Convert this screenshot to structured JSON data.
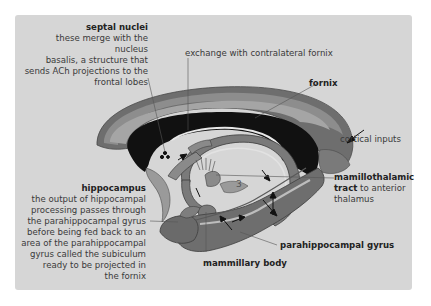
{
  "figure": {
    "labels": {
      "septal_nuclei": {
        "title": "septal nuclei",
        "body": [
          "these merge with the nucleus",
          "basalis, a structure that",
          "sends ACh projections to the",
          "frontal lobes"
        ]
      },
      "exchange": {
        "text": "exchange with contralateral fornix"
      },
      "fornix": {
        "title": "fornix"
      },
      "cortical_inputs": {
        "text": "cortical inputs"
      },
      "hippocampus": {
        "title": "hippocampus",
        "body": [
          "the output of hippocampal",
          "processing passes through",
          "the parahippocampal gyrus",
          "before being fed back to an",
          "area of the parahippocampal",
          "gyrus called the subiculum",
          "ready to be projected in",
          "the fornix"
        ]
      },
      "mamillothalamic": {
        "title": "mamillothalamic",
        "title2": "tract",
        "rest": " to anterior",
        "line3": "thalamus"
      },
      "parahippocampal": {
        "title": "parahippocampal gyrus"
      },
      "mammillary": {
        "title": "mammillary body"
      },
      "third_ventricle_marker": "3"
    },
    "colors": {
      "panel_bg": "#d6d6d6",
      "cortex_dark": "#6e6e6e",
      "cortex_mid": "#8a8a8a",
      "cortex_light": "#a3a3a3",
      "corpus_callosum": "#111111",
      "fornix_fill": "#7a7a7a",
      "text": "#3a3a3a"
    }
  }
}
